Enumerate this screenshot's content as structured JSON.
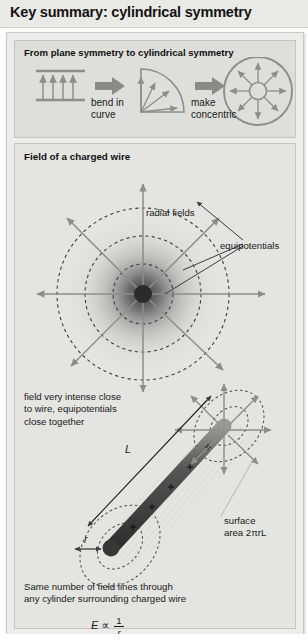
{
  "title": "Key summary: cylindrical symmetry",
  "panel1": {
    "header": "From plane symmetry to cylindrical symmetry",
    "steps": [
      {
        "name": "plane-field-icon",
        "caption": ""
      },
      {
        "name": "bend-arrow-icon",
        "caption_line1": "bend in",
        "caption_line2": "curve"
      },
      {
        "name": "wedge-field-icon",
        "caption": ""
      },
      {
        "name": "concentric-arrow-icon",
        "caption_line1": "make",
        "caption_line2": "concentric"
      },
      {
        "name": "radial-field-icon",
        "caption": ""
      }
    ]
  },
  "panel2": {
    "header": "Field of a charged wire",
    "labels": {
      "radial_fields": "radial fields",
      "equipotentials": "equipotentials",
      "intense_note_line1": "field very intense close",
      "intense_note_line2": "to wire, equipotentials",
      "intense_note_line3": "close together",
      "length_symbol": "L",
      "radius_symbol": "r",
      "surface_line1": "surface",
      "surface_line2": "area 2πrL",
      "flux_note_line1": "Same number of field lines through",
      "flux_note_line2": "any cylinder surrounding charged wire"
    },
    "formula": {
      "lhs": "E",
      "relation": "∝",
      "numerator": "1",
      "denominator": "r"
    }
  },
  "colors": {
    "title_bar": "#e9e9e6",
    "card_bg": "#ececeb",
    "panel1_bg": "#dededa",
    "panel2_bg": "#e4e4e1",
    "ink": "#1c1c1c",
    "arrow_gray": "#8d8d8a",
    "wire_dark": "#3a3a3a"
  }
}
